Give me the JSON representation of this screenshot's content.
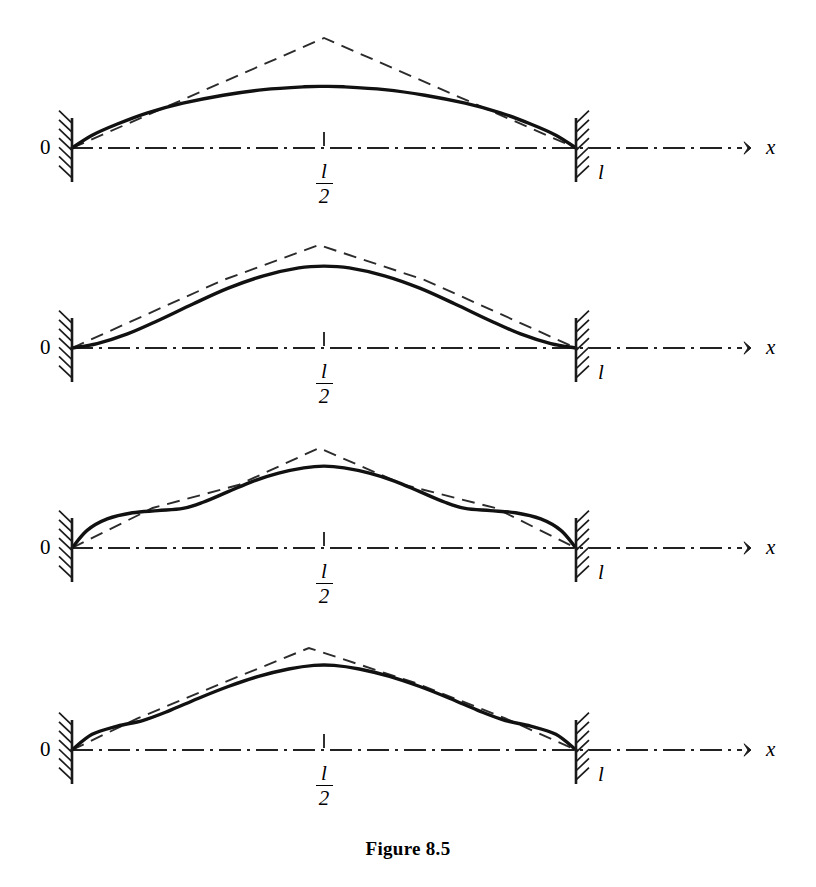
{
  "figure": {
    "caption": "Figure 8.5",
    "domain": "beam-deflection-approximation",
    "panel_count": 4
  },
  "labels": {
    "origin": "0",
    "axis_x": "x",
    "length_end": "l",
    "midpoint_numerator": "l",
    "midpoint_denominator": "2"
  },
  "colors": {
    "ink": "#1a1a1a",
    "exact_curve": "#111111",
    "approx_curve": "#2b2b2b",
    "axis": "#222222",
    "background": "#ffffff"
  },
  "geometry": {
    "left_support_x": 72,
    "right_support_x": 576,
    "axis_y": 148,
    "axis_start_x": 72,
    "axis_end_x": 742,
    "arrow_tip_x": 748,
    "midpoint_x": 324,
    "panel_pitch": 200,
    "span": 504
  },
  "chart_data": {
    "type": "line",
    "title": "Figure 8.5",
    "xlabel": "x",
    "ylabel": "",
    "x_ticks": [
      "0",
      "l/2",
      "l"
    ],
    "x_tick_positions": [
      0,
      0.5,
      1.0
    ],
    "grid": false,
    "legend": false,
    "panels": [
      {
        "index": 1,
        "name": "one-element-approximation",
        "segments": 2,
        "axis_y": 148,
        "exact": {
          "name": "exact-deflection-curve",
          "style": "solid",
          "points": [
            [
              0.0,
              0.0
            ],
            [
              0.04,
              0.16
            ],
            [
              0.09,
              0.3
            ],
            [
              0.15,
              0.44
            ],
            [
              0.22,
              0.56
            ],
            [
              0.3,
              0.66
            ],
            [
              0.38,
              0.73
            ],
            [
              0.46,
              0.765
            ],
            [
              0.5,
              0.77
            ],
            [
              0.54,
              0.765
            ],
            [
              0.62,
              0.73
            ],
            [
              0.7,
              0.66
            ],
            [
              0.78,
              0.56
            ],
            [
              0.85,
              0.44
            ],
            [
              0.91,
              0.3
            ],
            [
              0.96,
              0.16
            ],
            [
              1.0,
              0.0
            ]
          ]
        },
        "approx": {
          "name": "piecewise-linear-approximation",
          "style": "dashed",
          "vertices": [
            [
              0.0,
              0.0
            ],
            [
              0.5,
              1.0
            ],
            [
              1.0,
              0.0
            ]
          ]
        },
        "peak_amplitude_px": 80,
        "approx_peak_amplitude_px": 110
      },
      {
        "index": 2,
        "name": "two-element-approximation",
        "segments": 3,
        "axis_y": 348,
        "exact": {
          "name": "exact-deflection-curve",
          "style": "solid",
          "points": [
            [
              0.0,
              0.0
            ],
            [
              0.05,
              0.05
            ],
            [
              0.11,
              0.16
            ],
            [
              0.17,
              0.31
            ],
            [
              0.24,
              0.5
            ],
            [
              0.31,
              0.68
            ],
            [
              0.38,
              0.82
            ],
            [
              0.45,
              0.91
            ],
            [
              0.5,
              0.93
            ],
            [
              0.55,
              0.91
            ],
            [
              0.62,
              0.82
            ],
            [
              0.69,
              0.68
            ],
            [
              0.76,
              0.5
            ],
            [
              0.83,
              0.31
            ],
            [
              0.89,
              0.16
            ],
            [
              0.95,
              0.05
            ],
            [
              1.0,
              0.0
            ]
          ]
        },
        "approx": {
          "name": "piecewise-linear-approximation",
          "style": "dashed",
          "vertices": [
            [
              0.0,
              0.0
            ],
            [
              0.3,
              0.66
            ],
            [
              0.49,
              1.0
            ],
            [
              0.7,
              0.66
            ],
            [
              1.0,
              0.0
            ]
          ]
        },
        "peak_amplitude_px": 88,
        "approx_peak_amplitude_px": 103
      },
      {
        "index": 3,
        "name": "four-element-approximation",
        "segments": 5,
        "axis_y": 548,
        "exact": {
          "name": "exact-deflection-curve",
          "style": "solid",
          "points": [
            [
              0.0,
              0.0
            ],
            [
              0.03,
              0.2
            ],
            [
              0.07,
              0.33
            ],
            [
              0.12,
              0.4
            ],
            [
              0.17,
              0.425
            ],
            [
              0.22,
              0.45
            ],
            [
              0.26,
              0.52
            ],
            [
              0.31,
              0.64
            ],
            [
              0.36,
              0.76
            ],
            [
              0.41,
              0.85
            ],
            [
              0.46,
              0.91
            ],
            [
              0.5,
              0.93
            ],
            [
              0.54,
              0.91
            ],
            [
              0.59,
              0.85
            ],
            [
              0.64,
              0.76
            ],
            [
              0.69,
              0.64
            ],
            [
              0.74,
              0.52
            ],
            [
              0.78,
              0.45
            ],
            [
              0.83,
              0.425
            ],
            [
              0.88,
              0.4
            ],
            [
              0.93,
              0.33
            ],
            [
              0.97,
              0.2
            ],
            [
              1.0,
              0.0
            ]
          ]
        },
        "approx": {
          "name": "piecewise-linear-approximation",
          "style": "dashed",
          "vertices": [
            [
              0.0,
              0.0
            ],
            [
              0.16,
              0.4
            ],
            [
              0.33,
              0.63
            ],
            [
              0.49,
              1.0
            ],
            [
              0.66,
              0.63
            ],
            [
              0.84,
              0.4
            ],
            [
              1.0,
              0.0
            ]
          ]
        },
        "peak_amplitude_px": 88,
        "approx_peak_amplitude_px": 100
      },
      {
        "index": 4,
        "name": "many-element-approximation",
        "segments": 6,
        "axis_y": 750,
        "exact": {
          "name": "exact-deflection-curve",
          "style": "solid",
          "points": [
            [
              0.0,
              0.0
            ],
            [
              0.04,
              0.17
            ],
            [
              0.09,
              0.26
            ],
            [
              0.14,
              0.32
            ],
            [
              0.19,
              0.42
            ],
            [
              0.25,
              0.56
            ],
            [
              0.31,
              0.69
            ],
            [
              0.37,
              0.8
            ],
            [
              0.43,
              0.88
            ],
            [
              0.48,
              0.92
            ],
            [
              0.52,
              0.92
            ],
            [
              0.57,
              0.88
            ],
            [
              0.63,
              0.8
            ],
            [
              0.69,
              0.69
            ],
            [
              0.75,
              0.56
            ],
            [
              0.81,
              0.42
            ],
            [
              0.86,
              0.32
            ],
            [
              0.91,
              0.26
            ],
            [
              0.96,
              0.17
            ],
            [
              1.0,
              0.0
            ]
          ]
        },
        "approx": {
          "name": "piecewise-linear-approximation",
          "style": "dashed",
          "vertices": [
            [
              0.0,
              0.0
            ],
            [
              0.13,
              0.31
            ],
            [
              0.3,
              0.66
            ],
            [
              0.47,
              1.0
            ],
            [
              0.68,
              0.66
            ],
            [
              0.86,
              0.31
            ],
            [
              1.0,
              0.0
            ]
          ]
        },
        "peak_amplitude_px": 92,
        "approx_peak_amplitude_px": 102
      }
    ]
  }
}
